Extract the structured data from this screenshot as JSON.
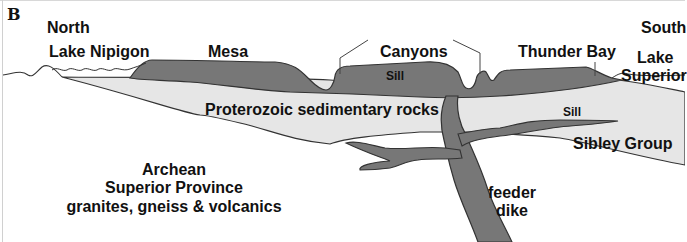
{
  "figure": {
    "panel_label": "B",
    "colors": {
      "background": "#ffffff",
      "sediment_fill": "#e6e6e6",
      "intrusion_fill": "#777777",
      "outline": "#333333",
      "text": "#111111"
    },
    "labels": {
      "north": "North",
      "south": "South",
      "lake_nipigon": "Lake Nipigon",
      "mesa": "Mesa",
      "canyons": "Canyons",
      "thunder_bay": "Thunder Bay",
      "lake_superior_line1": "Lake",
      "lake_superior_line2": "Superior",
      "sill_upper": "Sill",
      "sill_lower": "Sill",
      "proterozoic": "Proterozoic sedimentary rocks",
      "sibley_group": "Sibley Group",
      "archean_line1": "Archean",
      "archean_line2": "Superior Province",
      "archean_line3": "granites, gneiss & volcanics",
      "feeder_line1": "feeder",
      "feeder_line2": "dike"
    },
    "units": [
      {
        "name": "Archean Superior Province basement",
        "fill": "white"
      },
      {
        "name": "Proterozoic sedimentary rocks (Sibley Group)",
        "fill": "light gray"
      },
      {
        "name": "Sill / feeder dike intrusions",
        "fill": "dark gray"
      }
    ]
  }
}
